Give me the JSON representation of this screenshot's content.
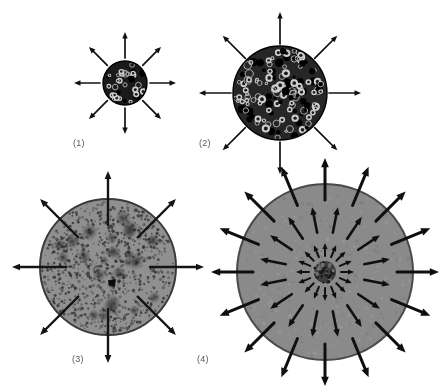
{
  "figure": {
    "width": 441,
    "height": 392,
    "background_color": "#ffffff",
    "panels": [
      {
        "id": "panel-1",
        "label": "(1)",
        "center_x": 125,
        "center_y": 83,
        "radius": 22,
        "fill_color": "#1a1a1a",
        "edge_color": "#000000",
        "texture": "coarse-bubbles",
        "texture_density": 34,
        "arrow_count": 8,
        "arrow_style": "external-radial",
        "arrow_color": "#111111",
        "arrow_inner_offset": 3,
        "arrow_length": 26,
        "core": null
      },
      {
        "id": "panel-2",
        "label": "(2)",
        "center_x": 280,
        "center_y": 93,
        "radius": 47,
        "fill_color": "#262626",
        "edge_color": "#000000",
        "texture": "dense-bubbles",
        "texture_density": 150,
        "arrow_count": 8,
        "arrow_style": "external-radial",
        "arrow_color": "#111111",
        "arrow_inner_offset": 2,
        "arrow_length": 32,
        "core": null
      },
      {
        "id": "panel-3",
        "label": "(3)",
        "center_x": 108,
        "center_y": 267,
        "radius": 68,
        "fill_color": "#909090",
        "edge_color": "#3a3a3a",
        "texture": "stipple-and-blobs",
        "texture_density": 900,
        "blob_count": 26,
        "arrow_count": 8,
        "arrow_style": "boundary-crossing",
        "arrow_color": "#141414",
        "arrow_inner_offset": -26,
        "arrow_length": 54,
        "core": {
          "offset_x": 4,
          "offset_y": 16,
          "radius": 4,
          "color": "#0d0d0d"
        }
      },
      {
        "id": "panel-4",
        "label": "(4)",
        "center_x": 325,
        "center_y": 272,
        "radius": 88,
        "fill_color": "#8a8a8a",
        "edge_color": "#4a4a4a",
        "texture": "smooth-grain",
        "texture_density": 260,
        "arrow_rings": [
          {
            "ring_radius_start": 16,
            "arrow_count": 16,
            "arrow_length": 13,
            "line_width": 2.0
          },
          {
            "ring_radius_start": 40,
            "arrow_count": 16,
            "arrow_length": 26,
            "line_width": 2.6
          },
          {
            "ring_radius_start": 72,
            "arrow_count": 16,
            "arrow_length": 42,
            "line_width": 3.0
          }
        ],
        "arrow_color": "#0f0f0f",
        "core": {
          "offset_x": 0,
          "offset_y": 0,
          "radius": 11,
          "color": "#3d3d3d"
        }
      }
    ]
  }
}
